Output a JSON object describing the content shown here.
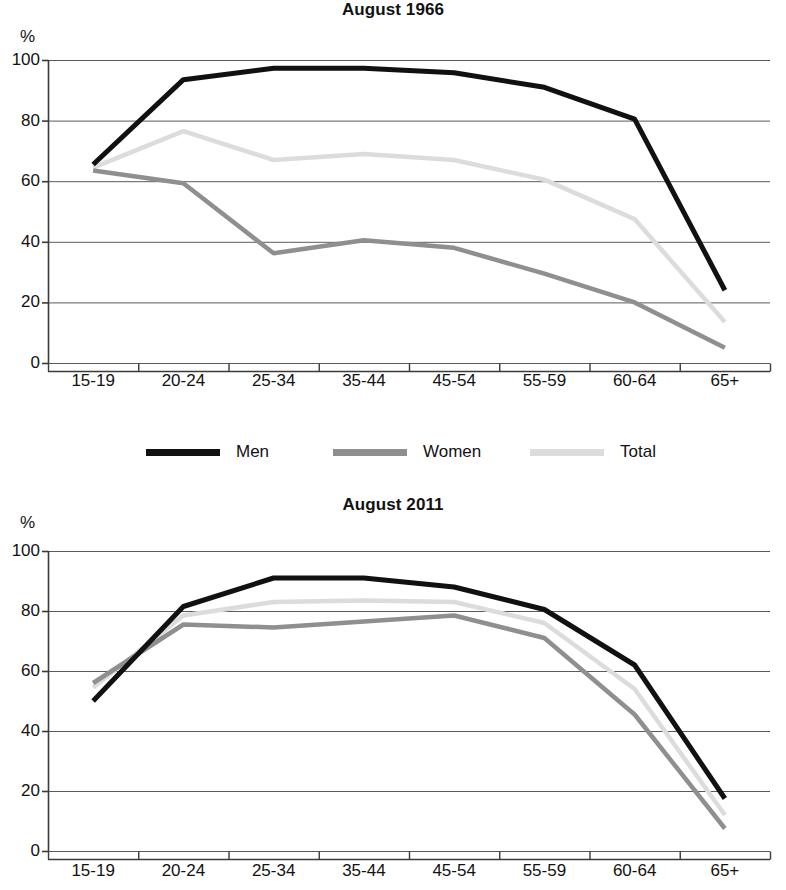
{
  "figure": {
    "axis_unit_label": "%",
    "legend": {
      "items": [
        {
          "key": "men",
          "label": "Men",
          "color": "#111111",
          "swatch_name": "legend-swatch-men"
        },
        {
          "key": "women",
          "label": "Women",
          "color": "#8f8f8f",
          "swatch_name": "legend-swatch-women"
        },
        {
          "key": "total",
          "label": "Total",
          "color": "#dcdcdc",
          "swatch_name": "legend-swatch-total"
        }
      ]
    }
  },
  "chart_data": [
    {
      "type": "line",
      "title": "August 1966",
      "xlabel": "",
      "ylabel": "%",
      "ylim": [
        0,
        100
      ],
      "yticks": [
        0,
        20,
        40,
        60,
        80,
        100
      ],
      "grid": true,
      "legend_position": "below",
      "categories": [
        "15-19",
        "20-24",
        "25-34",
        "35-44",
        "45-54",
        "55-59",
        "60-64",
        "65+"
      ],
      "series": [
        {
          "name": "Men",
          "color": "#111111",
          "values": [
            65.5,
            93.5,
            97.3,
            97.3,
            95.8,
            91.0,
            80.5,
            24.0
          ]
        },
        {
          "name": "Women",
          "color": "#8f8f8f",
          "values": [
            63.5,
            59.3,
            36.2,
            40.5,
            38.0,
            29.5,
            20.0,
            5.0
          ]
        },
        {
          "name": "Total",
          "color": "#dcdcdc",
          "values": [
            64.5,
            76.5,
            67.0,
            69.0,
            67.0,
            60.5,
            47.5,
            13.5
          ]
        }
      ]
    },
    {
      "type": "line",
      "title": "August 2011",
      "xlabel": "",
      "ylabel": "%",
      "ylim": [
        0,
        100
      ],
      "yticks": [
        0,
        20,
        40,
        60,
        80,
        100
      ],
      "grid": true,
      "legend_position": "below",
      "categories": [
        "15-19",
        "20-24",
        "25-34",
        "35-44",
        "45-54",
        "55-59",
        "60-64",
        "65+"
      ],
      "series": [
        {
          "name": "Men",
          "color": "#111111",
          "values": [
            50.0,
            81.5,
            91.0,
            91.0,
            88.0,
            80.5,
            62.0,
            17.5
          ]
        },
        {
          "name": "Women",
          "color": "#8f8f8f",
          "values": [
            56.0,
            75.5,
            74.5,
            76.5,
            78.5,
            71.0,
            45.5,
            7.5
          ]
        },
        {
          "name": "Total",
          "color": "#dcdcdc",
          "values": [
            54.5,
            78.5,
            83.0,
            83.5,
            83.0,
            76.0,
            54.0,
            12.0
          ]
        }
      ]
    }
  ]
}
